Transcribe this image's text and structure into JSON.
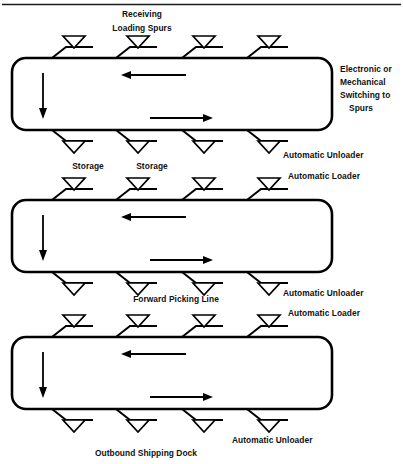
{
  "figure": {
    "top_rule": true,
    "line_color": "#000000",
    "background_color": "#ffffff"
  },
  "labels": {
    "receiving": "Receiving",
    "loading_spurs": "Loading Spurs",
    "switching": {
      "line1": "Electronic or",
      "line2": "Mechanical",
      "line3": "Switching to",
      "line4": "Spurs"
    },
    "storage_left": "Storage",
    "storage_right": "Storage",
    "automatic_unloader_1": "Automatic Unloader",
    "automatic_loader_1": "Automatic Loader",
    "forward_picking_line": "Forward Picking Line",
    "automatic_unloader_2": "Automatic Unloader",
    "automatic_loader_2": "Automatic Loader",
    "automatic_unloader_3": "Automatic Unloader",
    "outbound_shipping_dock": "Outbound Shipping Dock"
  },
  "loops": [
    {
      "name": "receiving-loop",
      "x": 12,
      "y": 58,
      "width": 320,
      "height": 72,
      "corner_radius": 14,
      "top_arrow": {
        "direction": "left",
        "x1": 186,
        "x2": 123,
        "y": 75
      },
      "bottom_arrow": {
        "direction": "right",
        "x1": 150,
        "x2": 212,
        "y": 118
      },
      "side_arrow": {
        "direction": "down",
        "x": 43,
        "y1": 73,
        "y2": 117
      },
      "top_spurs_x": [
        73,
        137,
        203,
        268
      ],
      "bottom_spurs_x": [
        73,
        137,
        203,
        268
      ]
    },
    {
      "name": "forward-picking-loop",
      "x": 12,
      "y": 200,
      "width": 320,
      "height": 72,
      "corner_radius": 14,
      "top_arrow": {
        "direction": "left",
        "x1": 186,
        "x2": 123,
        "y": 217
      },
      "bottom_arrow": {
        "direction": "right",
        "x1": 150,
        "x2": 212,
        "y": 260
      },
      "side_arrow": {
        "direction": "down",
        "x": 43,
        "y1": 215,
        "y2": 259
      },
      "top_spurs_x": [
        73,
        137,
        203,
        268
      ],
      "bottom_spurs_x": [
        73,
        137,
        203,
        268
      ]
    },
    {
      "name": "outbound-loop",
      "x": 12,
      "y": 337,
      "width": 320,
      "height": 72,
      "corner_radius": 14,
      "top_arrow": {
        "direction": "left",
        "x1": 186,
        "x2": 123,
        "y": 354
      },
      "bottom_arrow": {
        "direction": "right",
        "x1": 150,
        "x2": 212,
        "y": 397
      },
      "side_arrow": {
        "direction": "down",
        "x": 43,
        "y1": 352,
        "y2": 396
      },
      "top_spurs_x": [
        73,
        137,
        203,
        268
      ],
      "bottom_spurs_x": [
        73,
        137,
        203,
        268
      ]
    }
  ],
  "symbols": {
    "spur_triangle": "inverted-triangle",
    "flow_arrow": "arrow"
  }
}
